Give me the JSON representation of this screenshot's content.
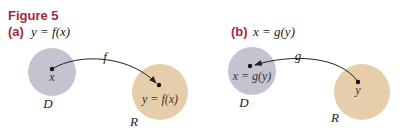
{
  "figure": {
    "title": "Figure 5",
    "colors": {
      "title": "#a32a3a",
      "domain_fill": "#c4c4d0",
      "range_fill": "#e6ceaa",
      "arrow": "#222222"
    },
    "panels": [
      {
        "label": "(a)",
        "equation": "y = f(x)",
        "arrow_label": "f",
        "arrow_direction": "D to R",
        "domain_set": {
          "name": "D",
          "point_label": "x"
        },
        "range_set": {
          "name": "R",
          "point_label": "y = f(x)"
        }
      },
      {
        "label": "(b)",
        "equation": "x = g(y)",
        "arrow_label": "g",
        "arrow_direction": "R to D",
        "domain_set": {
          "name": "D",
          "point_label": "x = g(y)"
        },
        "range_set": {
          "name": "R",
          "point_label": "y"
        }
      }
    ]
  }
}
